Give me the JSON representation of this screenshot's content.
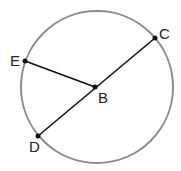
{
  "diagram": {
    "circle": {
      "cx": 97,
      "cy": 87,
      "r": 76,
      "stroke": "#8c8c8c"
    },
    "points": {
      "B": {
        "label": "B",
        "x": 95,
        "y": 87,
        "lx": 98,
        "ly": 103
      },
      "C": {
        "label": "C",
        "x": 155,
        "y": 38,
        "lx": 159,
        "ly": 39
      },
      "D": {
        "label": "D",
        "x": 38,
        "y": 136,
        "lx": 29,
        "ly": 152
      },
      "E": {
        "label": "E",
        "x": 25,
        "y": 61,
        "lx": 10,
        "ly": 66
      }
    },
    "segments": [
      [
        "E",
        "B"
      ],
      [
        "D",
        "C"
      ]
    ],
    "line_color": "#111111"
  }
}
